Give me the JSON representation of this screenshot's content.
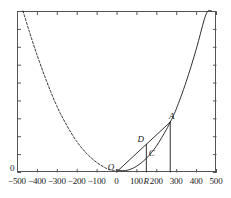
{
  "chart_data": {
    "type": "line",
    "title": "",
    "xlabel": "",
    "ylabel": "",
    "xlim": [
      -500,
      500
    ],
    "ylim": [
      0,
      1000
    ],
    "grid": false,
    "legend": null,
    "x_ticks": [
      -500,
      -400,
      -300,
      -200,
      -100,
      0,
      100,
      200,
      300,
      400,
      500
    ],
    "x_tick_labels": [
      "-500",
      "-400",
      "-300",
      "-200",
      "-100",
      "0",
      "100",
      "200",
      "300",
      "400",
      "500"
    ],
    "y_tick_labels": [
      "0"
    ],
    "y_axis_origin_label": "0",
    "series": [
      {
        "name": "parabola-dashed-branch",
        "style": "dashed",
        "x": [
          -470,
          -440,
          -400,
          -350,
          -300,
          -250,
          -200,
          -150,
          -100,
          -50,
          -20,
          0
        ],
        "y": [
          1000,
          880,
          730,
          560,
          410,
          290,
          190,
          115,
          60,
          22,
          10,
          13
        ]
      },
      {
        "name": "parabola-solid-branch",
        "style": "solid",
        "x": [
          0,
          30,
          60,
          100,
          150,
          200,
          250,
          270,
          300,
          350,
          400,
          450,
          478
        ],
        "y": [
          13,
          8,
          13,
          35,
          85,
          160,
          262,
          310,
          390,
          560,
          760,
          980,
          1000
        ]
      },
      {
        "name": "chord-O-to-A",
        "style": "solid",
        "x": [
          0,
          270
        ],
        "y": [
          0,
          310
        ]
      },
      {
        "name": "vertical-segment-at-R",
        "style": "solid",
        "x": [
          150,
          150
        ],
        "y": [
          0,
          172
        ]
      },
      {
        "name": "vertical-drop-at-A",
        "style": "solid",
        "x": [
          270,
          270
        ],
        "y": [
          0,
          310
        ]
      }
    ],
    "annotations": [
      {
        "label": "O",
        "x": 0,
        "y": 0,
        "role": "origin-point"
      },
      {
        "label": "D",
        "x": 150,
        "y": 172,
        "role": "chord-intersection-upper"
      },
      {
        "label": "C",
        "x": 150,
        "y": 85,
        "role": "curve-intersection-lower"
      },
      {
        "label": "A",
        "x": 270,
        "y": 310,
        "role": "curve-point-upper-right"
      },
      {
        "label": "R",
        "x": 150,
        "y": 0,
        "role": "x-axis-marker"
      }
    ],
    "colors": {
      "curve": "#1a1a1a",
      "axis": "#555555",
      "text": "#1a1a1a",
      "background": "#ffffff"
    }
  },
  "figure": {
    "frame": {
      "left": 17,
      "top": 11,
      "right": 216,
      "bottom": 172
    }
  }
}
